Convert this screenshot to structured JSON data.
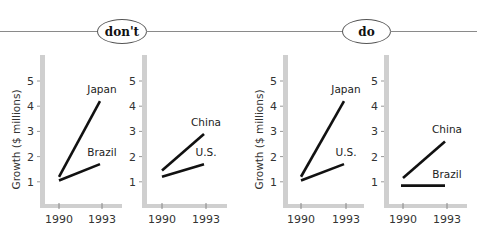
{
  "sections": [
    {
      "label": "don't"
    },
    {
      "label": "do"
    }
  ],
  "colors": {
    "axis": "#cfcfcf",
    "line": "#111111",
    "rule": "#8a8a8a"
  },
  "chart_data": [
    {
      "type": "line",
      "title": "",
      "section": "don't",
      "xlabel": "",
      "ylabel": "Growth ($ millions)",
      "categories": [
        "1990",
        "1993"
      ],
      "yticks": [
        1,
        2,
        3,
        4,
        5
      ],
      "ylim": [
        0,
        6
      ],
      "grid": false,
      "series": [
        {
          "name": "Japan",
          "values": [
            1.2,
            4.2
          ]
        },
        {
          "name": "Brazil",
          "values": [
            1.05,
            1.7
          ]
        }
      ]
    },
    {
      "type": "line",
      "title": "",
      "section": "don't",
      "xlabel": "",
      "ylabel": "",
      "categories": [
        "1990",
        "1993"
      ],
      "yticks": [
        1,
        2,
        3,
        4,
        5
      ],
      "ylim": [
        0,
        6
      ],
      "grid": false,
      "series": [
        {
          "name": "China",
          "values": [
            1.45,
            2.9
          ]
        },
        {
          "name": "U.S.",
          "values": [
            1.2,
            1.7
          ]
        }
      ]
    },
    {
      "type": "line",
      "title": "",
      "section": "do",
      "xlabel": "",
      "ylabel": "Growth ($ millions)",
      "categories": [
        "1990",
        "1993"
      ],
      "yticks": [
        1,
        2,
        3,
        4,
        5
      ],
      "ylim": [
        0,
        6
      ],
      "grid": false,
      "series": [
        {
          "name": "Japan",
          "values": [
            1.2,
            4.2
          ]
        },
        {
          "name": "U.S.",
          "values": [
            1.05,
            1.7
          ]
        }
      ]
    },
    {
      "type": "line",
      "title": "",
      "section": "do",
      "xlabel": "",
      "ylabel": "",
      "categories": [
        "1990",
        "1993"
      ],
      "yticks": [
        1,
        2,
        3,
        4,
        5
      ],
      "ylim": [
        0,
        6
      ],
      "grid": false,
      "series": [
        {
          "name": "China",
          "values": [
            1.15,
            2.6
          ]
        },
        {
          "name": "Brazil",
          "values": [
            0.85,
            0.85
          ]
        }
      ]
    }
  ]
}
